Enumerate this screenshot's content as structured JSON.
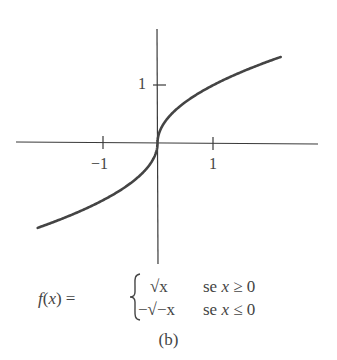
{
  "chart_data": {
    "type": "line",
    "title": "",
    "xlabel": "",
    "ylabel": "",
    "x_ticks": [
      {
        "value": -1,
        "label": "−1"
      },
      {
        "value": 1,
        "label": "1"
      }
    ],
    "y_ticks": [
      {
        "value": 1,
        "label": "1"
      }
    ],
    "xlim": [
      -2.6,
      3.2
    ],
    "ylim": [
      -2.3,
      2.0
    ],
    "grid": false,
    "legend": null,
    "series": [
      {
        "name": "f(x)",
        "function": "f(x) = sqrt(x) if x >= 0; -sqrt(-x) if x <= 0",
        "x": [
          -2.14,
          -2.0,
          -1.5,
          -1.0,
          -0.5,
          -0.25,
          -0.1,
          -0.02,
          0,
          0.02,
          0.1,
          0.25,
          0.5,
          1.0,
          1.5,
          2.0,
          2.2
        ],
        "y": [
          -1.46,
          -1.414,
          -1.225,
          -1.0,
          -0.707,
          -0.5,
          -0.316,
          -0.141,
          0,
          0.141,
          0.316,
          0.5,
          0.707,
          1.0,
          1.225,
          1.414,
          1.483
        ]
      }
    ]
  },
  "axes": {
    "x_tick_labels": [
      "−1",
      "1"
    ],
    "y_tick_labels": [
      "1"
    ]
  },
  "formula": {
    "lhs_f": "f",
    "lhs_open": "(",
    "lhs_x": "x",
    "lhs_close": ") =",
    "case1_expr": "√x",
    "case1_cond_word": "se",
    "case1_cond_var": "x",
    "case1_cond_rel": "≥ 0",
    "case2_expr": "−√−x",
    "case2_cond_word": "se",
    "case2_cond_var": "x",
    "case2_cond_rel": "≤ 0"
  },
  "caption": "(b)",
  "colors": {
    "axis": "#3a3a3a",
    "curve": "#444444",
    "text": "#444444"
  }
}
